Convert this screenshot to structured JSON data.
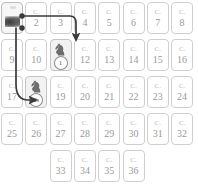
{
  "board": {
    "columns": 8,
    "rows": 5,
    "card_prefix": "C.",
    "cards": [
      {
        "id": 1,
        "label": "C.",
        "number": "1",
        "type": "photo",
        "row": 1,
        "col": 1
      },
      {
        "id": 2,
        "label": "C.",
        "number": "2",
        "type": "plain",
        "row": 1,
        "col": 2
      },
      {
        "id": 3,
        "label": "C.",
        "number": "3",
        "type": "plain",
        "row": 1,
        "col": 3
      },
      {
        "id": 4,
        "label": "C.",
        "number": "4",
        "type": "plain",
        "row": 1,
        "col": 4
      },
      {
        "id": 5,
        "label": "C.",
        "number": "5",
        "type": "plain",
        "row": 1,
        "col": 5
      },
      {
        "id": 6,
        "label": "C.",
        "number": "6",
        "type": "plain",
        "row": 1,
        "col": 6
      },
      {
        "id": 7,
        "label": "C.",
        "number": "7",
        "type": "plain",
        "row": 1,
        "col": 7
      },
      {
        "id": 8,
        "label": "C.",
        "number": "8",
        "type": "plain",
        "row": 1,
        "col": 8
      },
      {
        "id": 9,
        "label": "C.",
        "number": "9",
        "type": "plain",
        "row": 2,
        "col": 1
      },
      {
        "id": 10,
        "label": "C.",
        "number": "10",
        "type": "plain",
        "row": 2,
        "col": 2
      },
      {
        "id": 11,
        "label": "C.",
        "number": "11",
        "type": "knight",
        "row": 2,
        "col": 3,
        "badge": "1"
      },
      {
        "id": 12,
        "label": "C.",
        "number": "12",
        "type": "plain",
        "row": 2,
        "col": 4
      },
      {
        "id": 13,
        "label": "C.",
        "number": "13",
        "type": "plain",
        "row": 2,
        "col": 5
      },
      {
        "id": 14,
        "label": "C.",
        "number": "14",
        "type": "plain",
        "row": 2,
        "col": 6
      },
      {
        "id": 15,
        "label": "C.",
        "number": "15",
        "type": "plain",
        "row": 2,
        "col": 7
      },
      {
        "id": 16,
        "label": "C.",
        "number": "16",
        "type": "plain",
        "row": 2,
        "col": 8
      },
      {
        "id": 17,
        "label": "C.",
        "number": "17",
        "type": "plain",
        "row": 3,
        "col": 1
      },
      {
        "id": 18,
        "label": "C.",
        "number": "18",
        "type": "knight",
        "row": 3,
        "col": 2,
        "badge": "2s"
      },
      {
        "id": 19,
        "label": "C.",
        "number": "19",
        "type": "plain",
        "row": 3,
        "col": 3
      },
      {
        "id": 20,
        "label": "C.",
        "number": "20",
        "type": "plain",
        "row": 3,
        "col": 4
      },
      {
        "id": 21,
        "label": "C.",
        "number": "21",
        "type": "plain",
        "row": 3,
        "col": 5
      },
      {
        "id": 22,
        "label": "C.",
        "number": "22",
        "type": "plain",
        "row": 3,
        "col": 6
      },
      {
        "id": 23,
        "label": "C.",
        "number": "23",
        "type": "plain",
        "row": 3,
        "col": 7
      },
      {
        "id": 24,
        "label": "C.",
        "number": "24",
        "type": "plain",
        "row": 3,
        "col": 8
      },
      {
        "id": 25,
        "label": "C.",
        "number": "25",
        "type": "plain",
        "row": 4,
        "col": 1
      },
      {
        "id": 26,
        "label": "C.",
        "number": "26",
        "type": "plain",
        "row": 4,
        "col": 2
      },
      {
        "id": 27,
        "label": "C.",
        "number": "27",
        "type": "plain",
        "row": 4,
        "col": 3
      },
      {
        "id": 28,
        "label": "C.",
        "number": "28",
        "type": "plain",
        "row": 4,
        "col": 4
      },
      {
        "id": 29,
        "label": "C.",
        "number": "29",
        "type": "plain",
        "row": 4,
        "col": 5
      },
      {
        "id": 30,
        "label": "C.",
        "number": "30",
        "type": "plain",
        "row": 4,
        "col": 6
      },
      {
        "id": 31,
        "label": "C.",
        "number": "31",
        "type": "plain",
        "row": 4,
        "col": 7
      },
      {
        "id": 32,
        "label": "C.",
        "number": "32",
        "type": "plain",
        "row": 4,
        "col": 8
      },
      {
        "id": 33,
        "label": "C.",
        "number": "33",
        "type": "plain",
        "row": 5,
        "col": 3
      },
      {
        "id": 34,
        "label": "C.",
        "number": "34",
        "type": "plain",
        "row": 5,
        "col": 4
      },
      {
        "id": 35,
        "label": "C.",
        "number": "35",
        "type": "plain",
        "row": 5,
        "col": 5
      },
      {
        "id": 36,
        "label": "C.",
        "number": "36",
        "type": "plain",
        "row": 5,
        "col": 6
      }
    ],
    "connections": [
      {
        "from": 1,
        "to": 11,
        "style": "curved-arrow"
      },
      {
        "from": 1,
        "to": 18,
        "style": "curved-arrow"
      }
    ],
    "colors": {
      "card_border": "#cfcfcf",
      "card_text": "#9a9a9a",
      "knight_fill": "#6e6e6e",
      "arrow": "#3a3a3a",
      "background": "#ffffff"
    }
  }
}
